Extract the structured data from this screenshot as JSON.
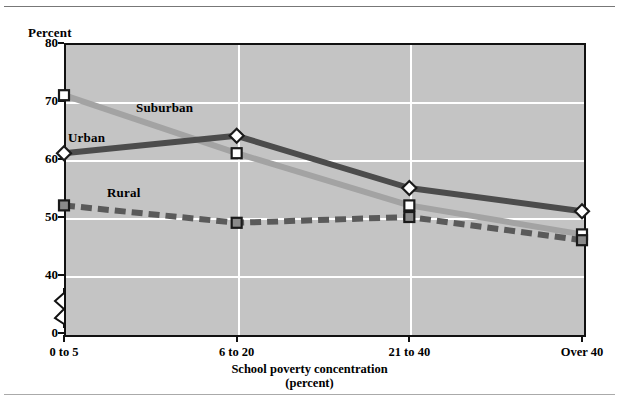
{
  "chart_data": {
    "type": "line",
    "title": "",
    "subtitle": "",
    "xlabel": "School poverty concentration",
    "xlabel_line2": "(percent)",
    "ylabel": "Percent",
    "categories": [
      "0 to 5",
      "6 to 20",
      "21 to 40",
      "Over 40"
    ],
    "ylim": [
      0,
      80
    ],
    "yticks": [
      0,
      40,
      50,
      60,
      70,
      80
    ],
    "ytick_labels": [
      "0",
      "40",
      "50",
      "60",
      "70",
      "80"
    ],
    "y_axis_break": true,
    "grid": "horizontal-and-vertical",
    "grid_color": "#ffffff",
    "plot_background": "#c4c4c4",
    "legend_position": "inline-labels",
    "series": [
      {
        "name": "Suburban",
        "values": [
          71,
          61,
          52,
          47
        ],
        "color": "#a3a3a3",
        "marker": "open-square",
        "linestyle": "solid"
      },
      {
        "name": "Urban",
        "values": [
          61,
          64,
          55,
          51
        ],
        "color": "#4c4c4c",
        "marker": "open-diamond",
        "linestyle": "solid"
      },
      {
        "name": "Rural",
        "values": [
          52,
          49,
          50,
          46
        ],
        "color": "#5a5a5a",
        "marker": "filled-square",
        "linestyle": "dashed"
      }
    ]
  },
  "figure": {
    "top_rule": "horizontal-rule",
    "bottom_rule": "horizontal-rule"
  }
}
